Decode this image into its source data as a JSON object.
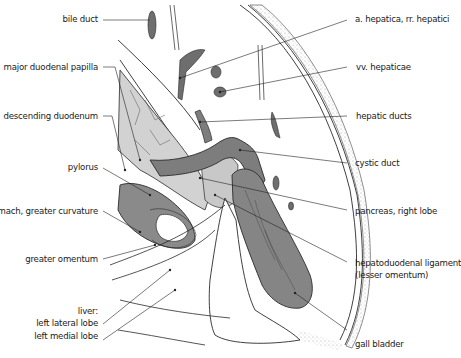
{
  "figure": {
    "type": "anatomical illustration",
    "colors": {
      "background": "#ffffff",
      "organ_dark": "#7a7a7a",
      "organ_mid": "#a9a9a9",
      "organ_light": "#d4d4d4",
      "outline": "#2a2a2a",
      "leader_line": "#222222"
    }
  },
  "labels_left": [
    {
      "id": "bile-duct",
      "text": "bile duct"
    },
    {
      "id": "major-duodenal-papilla",
      "text": "major duodenal papilla"
    },
    {
      "id": "descending-duodenum",
      "text": "descending duodenum"
    },
    {
      "id": "pylorus",
      "text": "pylorus"
    },
    {
      "id": "stomach-greater-curvature",
      "text": "stomach, greater curvature"
    },
    {
      "id": "greater-omentum",
      "text": "greater omentum"
    },
    {
      "id": "liver",
      "text": "liver:"
    },
    {
      "id": "left-lateral-lobe",
      "text": "left lateral lobe"
    },
    {
      "id": "left-medial-lobe",
      "text": "left medial lobe"
    }
  ],
  "labels_right": [
    {
      "id": "a-hepatica",
      "text": "a. hepatica, rr. hepatici"
    },
    {
      "id": "vv-hepaticae",
      "text": "vv. hepaticae"
    },
    {
      "id": "hepatic-ducts",
      "text": "hepatic ducts"
    },
    {
      "id": "cystic-duct",
      "text": "cystic duct"
    },
    {
      "id": "pancreas-right-lobe",
      "text": "pancreas, right lobe"
    },
    {
      "id": "hepatoduodenal-ligament",
      "text": "hepatoduodenal ligament"
    },
    {
      "id": "lesser-omentum",
      "text": "(lesser omentum)"
    },
    {
      "id": "gall-bladder",
      "text": "gall bladder"
    }
  ]
}
